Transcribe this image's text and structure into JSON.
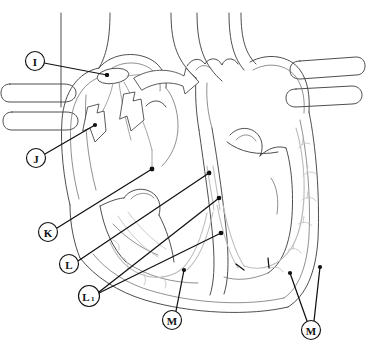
{
  "figure": {
    "background_color": "#ffffff",
    "width": 366,
    "height": 357,
    "line_color": "#3a3a3a",
    "conduction_color": "#bdbdbd",
    "label_color": "#111111"
  },
  "callouts": [
    {
      "id": "I",
      "label": "I",
      "subscript": "",
      "circle": {
        "cx": 35,
        "cy": 61,
        "rx": 9.5,
        "ry": 9.5
      },
      "leaders": [
        {
          "x1": 44,
          "y1": 63,
          "x2": 107,
          "y2": 75
        }
      ],
      "target_name": "sinoatrial-node"
    },
    {
      "id": "J",
      "label": "J",
      "subscript": "",
      "circle": {
        "cx": 36,
        "cy": 158,
        "rx": 9.5,
        "ry": 9.5
      },
      "leaders": [
        {
          "x1": 45,
          "y1": 154,
          "x2": 95,
          "y2": 125
        }
      ],
      "target_name": "internodal-pathway"
    },
    {
      "id": "K",
      "label": "K",
      "subscript": "",
      "circle": {
        "cx": 48,
        "cy": 232,
        "rx": 9.5,
        "ry": 9.5
      },
      "leaders": [
        {
          "x1": 57,
          "y1": 228,
          "x2": 152,
          "y2": 169
        }
      ],
      "target_name": "atrioventricular-node"
    },
    {
      "id": "L",
      "label": "L",
      "subscript": "",
      "circle": {
        "cx": 69,
        "cy": 264,
        "rx": 9.5,
        "ry": 9.5
      },
      "leaders": [
        {
          "x1": 78,
          "y1": 261,
          "x2": 209,
          "y2": 173
        }
      ],
      "target_name": "bundle-of-his"
    },
    {
      "id": "L1",
      "label": "L",
      "subscript": "1",
      "circle": {
        "cx": 89,
        "cy": 296,
        "rx": 10.5,
        "ry": 10.5
      },
      "leaders": [
        {
          "x1": 99,
          "y1": 292,
          "x2": 219,
          "y2": 198
        },
        {
          "x1": 99,
          "y1": 293,
          "x2": 221,
          "y2": 233
        }
      ],
      "target_name": "bundle-branches"
    },
    {
      "id": "M_left",
      "label": "M",
      "subscript": "",
      "circle": {
        "cx": 172,
        "cy": 320,
        "rx": 9.5,
        "ry": 9.5
      },
      "leaders": [
        {
          "x1": 176,
          "y1": 311,
          "x2": 184,
          "y2": 270
        }
      ],
      "target_name": "purkinje-fibers-left"
    },
    {
      "id": "M_right",
      "label": "M",
      "subscript": "",
      "circle": {
        "cx": 311,
        "cy": 330,
        "rx": 9.5,
        "ry": 9.5
      },
      "leaders": [
        {
          "x1": 307,
          "y1": 321,
          "x2": 290,
          "y2": 273
        },
        {
          "x1": 314,
          "y1": 321,
          "x2": 320,
          "y2": 267
        }
      ],
      "target_name": "purkinje-fibers-right"
    }
  ],
  "structures": [
    {
      "name": "superior-vena-cava"
    },
    {
      "name": "aorta"
    },
    {
      "name": "pulmonary-artery"
    },
    {
      "name": "right-pulmonary-veins"
    },
    {
      "name": "left-pulmonary-veins"
    },
    {
      "name": "right-atrium"
    },
    {
      "name": "left-atrium"
    },
    {
      "name": "right-ventricle"
    },
    {
      "name": "left-ventricle"
    },
    {
      "name": "interventricular-septum"
    },
    {
      "name": "tricuspid-valve"
    },
    {
      "name": "mitral-valve"
    },
    {
      "name": "aortic-valve"
    },
    {
      "name": "sinoatrial-node"
    },
    {
      "name": "atrioventricular-node"
    },
    {
      "name": "bundle-of-his"
    },
    {
      "name": "bundle-branches"
    },
    {
      "name": "purkinje-fibers"
    }
  ],
  "flow_arrows": [
    {
      "name": "flow-arrow-down-left"
    },
    {
      "name": "flow-arrow-down-center"
    },
    {
      "name": "flow-arrow-right"
    }
  ]
}
